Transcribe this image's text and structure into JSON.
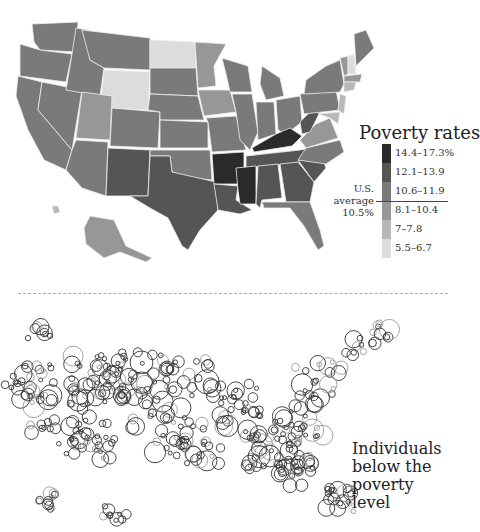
{
  "chart_data": [
    {
      "type": "choropleth",
      "title": "Poverty rates",
      "legend": {
        "position": "right",
        "bins": [
          {
            "label": "14.4–17.3%",
            "color": "#2a2a2a"
          },
          {
            "label": "12.1–13.9",
            "color": "#555555"
          },
          {
            "label": "10.6–11.9",
            "color": "#7a7a7a"
          },
          {
            "label": "8.1–10.4",
            "color": "#979797"
          },
          {
            "label": "7–7.8",
            "color": "#b8b8b8"
          },
          {
            "label": "5.5–6.7",
            "color": "#dcdcdc"
          }
        ],
        "average_label": "U.S. average",
        "average_value": "10.5%"
      },
      "states": {
        "WA": "10.6–11.9",
        "OR": "10.6–11.9",
        "CA": "10.6–11.9",
        "NV": "10.6–11.9",
        "ID": "10.6–11.9",
        "MT": "10.6–11.9",
        "WY": "5.5–6.7",
        "UT": "8.1–10.4",
        "AZ": "10.6–11.9",
        "NM": "12.1–13.9",
        "CO": "10.6–11.9",
        "ND": "5.5–6.7",
        "SD": "10.6–11.9",
        "NE": "10.6–11.9",
        "KS": "10.6–11.9",
        "OK": "10.6–11.9",
        "TX": "12.1–13.9",
        "MN": "8.1–10.4",
        "IA": "8.1–10.4",
        "MO": "10.6–11.9",
        "AR": "14.4–17.3%",
        "LA": "12.1–13.9",
        "WI": "10.6–11.9",
        "IL": "10.6–11.9",
        "MI": "10.6–11.9",
        "IN": "10.6–11.9",
        "OH": "10.6–11.9",
        "KY": "14.4–17.3%",
        "TN": "12.1–13.9",
        "MS": "14.4–17.3%",
        "AL": "12.1–13.9",
        "GA": "12.1–13.9",
        "FL": "10.6–11.9",
        "SC": "12.1–13.9",
        "NC": "10.6–11.9",
        "VA": "8.1–10.4",
        "WV": "12.1–13.9",
        "PA": "10.6–11.9",
        "NY": "10.6–11.9",
        "ME": "10.6–11.9",
        "VT": "8.1–10.4",
        "NH": "5.5–6.7",
        "MA": "8.1–10.4",
        "CT": "7–7.8",
        "NJ": "7–7.8",
        "MD": "7–7.8",
        "AK": "8.1–10.4",
        "HI": "7–7.8"
      }
    },
    {
      "type": "scatter",
      "title": "Individuals below the poverty level",
      "title_lines": [
        "Individuals",
        "below the",
        "poverty level"
      ],
      "marker": "open-circle",
      "notes": "Proportional open circles over U.S. geography; densest clusters in Appalachia/Southeast, Texas, Southern California"
    }
  ]
}
